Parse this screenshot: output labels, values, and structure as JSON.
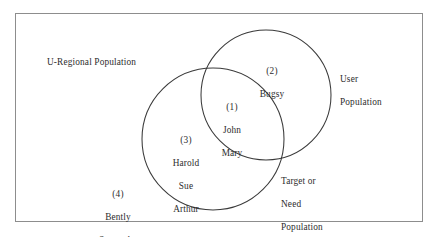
{
  "figure": {
    "type": "venn-diagram",
    "background_color": "#ffffff",
    "frame_color": "#8d8d8d",
    "stroke_color": "#3a3a3a",
    "text_color": "#2d2d2d"
  },
  "universe": {
    "label": "U-Regional Population"
  },
  "circles": {
    "left": {
      "name": "Target or Need Population",
      "label": "Target or\nNeed\nPopulation",
      "cx": 213,
      "cy": 139,
      "r": 71
    },
    "right": {
      "name": "User Population",
      "label": "User\nPopulation",
      "cx": 266,
      "cy": 95,
      "r": 65
    }
  },
  "regions": [
    {
      "id": 1,
      "number": "(1)",
      "description": "intersection of User Population and Target or Need Population",
      "members": [
        "John",
        "Mary"
      ]
    },
    {
      "id": 2,
      "number": "(2)",
      "description": "User Population only",
      "members": [
        "Bugsy"
      ]
    },
    {
      "id": 3,
      "number": "(3)",
      "description": "Target or Need Population only",
      "members": [
        "Harold",
        "Sue",
        "Arthur"
      ]
    },
    {
      "id": 4,
      "number": "(4)",
      "description": "outside both circles, within universe",
      "members": [
        "Bently",
        "Samantha"
      ]
    }
  ],
  "region_text": {
    "set1_number": "(1)",
    "set1_member_1": "John",
    "set1_member_2": "Mary",
    "set2_number": "(2)",
    "set2_member_1": "Bugsy",
    "set3_number": "(3)",
    "set3_member_1": "Harold",
    "set3_member_2": "Sue",
    "set3_member_3": "Arthur",
    "set4_number": "(4)",
    "set4_member_1": "Bently",
    "set4_member_2": "Samantha"
  },
  "labels": {
    "user_population_line1": "User",
    "user_population_line2": "Population",
    "target_population_line1": "Target or",
    "target_population_line2": "Need",
    "target_population_line3": "Population"
  }
}
